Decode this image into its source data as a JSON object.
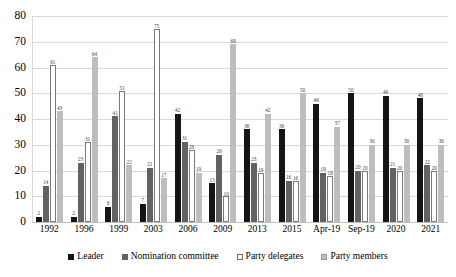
{
  "chart_data": {
    "type": "bar",
    "title": "",
    "subtitle": "",
    "xlabel": "",
    "ylabel": "",
    "ylim": [
      0,
      80
    ],
    "yticks": [
      0,
      10,
      20,
      30,
      40,
      50,
      60,
      70,
      80
    ],
    "grid": true,
    "legend_position": "bottom",
    "categories": [
      "1992",
      "1996",
      "1999",
      "2003",
      "2006",
      "2009",
      "2013",
      "2015",
      "Apr-19",
      "Sep-19",
      "2020",
      "2021"
    ],
    "series": [
      {
        "name": "Leader",
        "color": "#151515",
        "values": [
          2,
          2,
          6,
          7,
          42,
          15,
          36,
          36,
          46,
          50,
          49,
          48
        ]
      },
      {
        "name": "Nomination committee",
        "color": "#626262",
        "values": [
          14,
          23,
          41,
          21,
          31,
          26,
          23,
          16,
          19,
          20,
          21,
          22
        ]
      },
      {
        "name": "Party delegates",
        "color": "#ffffff",
        "values": [
          61,
          31,
          51,
          75,
          28,
          10,
          19,
          16,
          18,
          20,
          20,
          20
        ]
      },
      {
        "name": "Party members",
        "color": "#bdbdbd",
        "values": [
          43,
          64,
          22,
          17,
          19,
          69,
          42,
          50,
          37,
          30,
          30,
          30
        ]
      }
    ]
  }
}
